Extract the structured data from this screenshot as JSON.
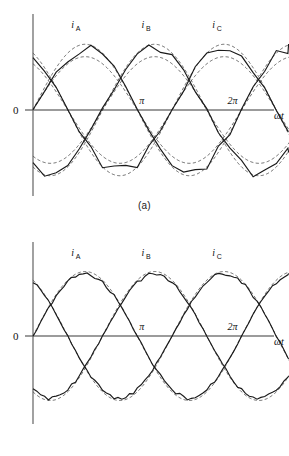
{
  "figure": {
    "panels": [
      {
        "id": "a",
        "caption": "(a)",
        "origin_label": "0",
        "x_ticks": [
          {
            "label": "π",
            "value": 3.14159
          },
          {
            "label": "2π",
            "value": 6.28319
          }
        ],
        "x_axis_label": "ωt",
        "phase_labels": [
          {
            "symbol": "i",
            "sub": "A"
          },
          {
            "symbol": "i",
            "sub": "B"
          },
          {
            "symbol": "i",
            "sub": "C"
          }
        ]
      },
      {
        "id": "b",
        "caption": "(b)",
        "origin_label": "0",
        "x_ticks": [
          {
            "label": "π",
            "value": 3.14159
          },
          {
            "label": "2π",
            "value": 6.28319
          }
        ],
        "x_axis_label": "ωt",
        "phase_labels": [
          {
            "symbol": "i",
            "sub": "A"
          },
          {
            "symbol": "i",
            "sub": "B"
          },
          {
            "symbol": "i",
            "sub": "C"
          }
        ]
      }
    ]
  },
  "colors": {
    "stroke": "#1a1a1a",
    "axis": "#7a7a7a",
    "dashed": "#444444",
    "background": "#ffffff"
  },
  "chart_data": [
    {
      "type": "line",
      "panel": "a",
      "title": "",
      "xlabel": "ωt",
      "ylabel": "",
      "xlim": [
        -0.25,
        7.2
      ],
      "ylim": [
        -1.35,
        1.35
      ],
      "grid": false,
      "legend": "inline-labels",
      "x_tick_values": [
        3.14159,
        6.28319
      ],
      "x_tick_labels": [
        "π",
        "2π"
      ],
      "steps_per_cycle": 18,
      "step_noise": 0.085,
      "series": [
        {
          "name": "i_A",
          "style": "stepped-solid",
          "phase_deg": 0,
          "amplitude": 1.0
        },
        {
          "name": "i_B",
          "style": "stepped-solid",
          "phase_deg": -120,
          "amplitude": 1.0
        },
        {
          "name": "i_C",
          "style": "stepped-solid",
          "phase_deg": -240,
          "amplitude": 1.0
        },
        {
          "name": "i_A ref outer",
          "style": "dashed-sine",
          "phase_deg": 0,
          "amplitude": 1.06
        },
        {
          "name": "i_A ref inner",
          "style": "dashed-sine",
          "phase_deg": 0,
          "amplitude": 0.86
        },
        {
          "name": "i_B ref outer",
          "style": "dashed-sine",
          "phase_deg": -120,
          "amplitude": 1.06
        },
        {
          "name": "i_B ref inner",
          "style": "dashed-sine",
          "phase_deg": -120,
          "amplitude": 0.86
        },
        {
          "name": "i_C ref outer",
          "style": "dashed-sine",
          "phase_deg": -240,
          "amplitude": 1.06
        },
        {
          "name": "i_C ref inner",
          "style": "dashed-sine",
          "phase_deg": -240,
          "amplitude": 0.86
        }
      ]
    },
    {
      "type": "line",
      "panel": "b",
      "title": "",
      "xlabel": "ωt",
      "ylabel": "",
      "xlim": [
        -0.25,
        7.2
      ],
      "ylim": [
        -1.35,
        1.35
      ],
      "grid": false,
      "legend": "inline-labels",
      "x_tick_values": [
        3.14159,
        6.28319
      ],
      "x_tick_labels": [
        "π",
        "2π"
      ],
      "steps_per_cycle": 54,
      "step_noise": 0.028,
      "series": [
        {
          "name": "i_A",
          "style": "stepped-solid",
          "phase_deg": 0,
          "amplitude": 1.0
        },
        {
          "name": "i_B",
          "style": "stepped-solid",
          "phase_deg": -120,
          "amplitude": 1.0
        },
        {
          "name": "i_C",
          "style": "stepped-solid",
          "phase_deg": -240,
          "amplitude": 1.0
        },
        {
          "name": "i_A ref",
          "style": "dashed-sine",
          "phase_deg": 0,
          "amplitude": 1.04
        },
        {
          "name": "i_B ref",
          "style": "dashed-sine",
          "phase_deg": -120,
          "amplitude": 1.04
        },
        {
          "name": "i_C ref",
          "style": "dashed-sine",
          "phase_deg": -240,
          "amplitude": 1.04
        }
      ]
    }
  ]
}
